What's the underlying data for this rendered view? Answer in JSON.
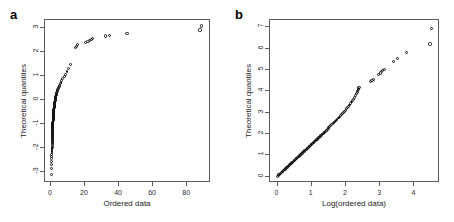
{
  "figure": {
    "width": 454,
    "height": 222,
    "background": "#ffffff",
    "point_color": "#111111",
    "axis_color": "#5a5a5a"
  },
  "panels": [
    {
      "letter": "a",
      "xlabel": "Ordered data",
      "ylabel": "Theoretical quantiles",
      "xticks": [
        "0",
        "20",
        "40",
        "60",
        "80"
      ],
      "yticks": [
        "-3",
        "-2",
        "-1",
        "0",
        "1",
        "2",
        "3"
      ]
    },
    {
      "letter": "b",
      "xlabel": "Log(ordered data)",
      "ylabel": "Theoretical quantiles",
      "xticks": [
        "0",
        "1",
        "2",
        "3",
        "4"
      ],
      "yticks": [
        "0",
        "1",
        "2",
        "3",
        "4",
        "5",
        "6",
        "7"
      ]
    }
  ],
  "chart_data": [
    {
      "type": "scatter",
      "panel": "a",
      "title": "a",
      "xlabel": "Ordered data",
      "ylabel": "Theoretical quantiles",
      "xlim": [
        -3.5,
        94
      ],
      "ylim": [
        -3.45,
        3.35
      ],
      "xticks": [
        0,
        20,
        40,
        60,
        80
      ],
      "yticks": [
        -3,
        -2,
        -1,
        0,
        1,
        2,
        3
      ],
      "grid": false,
      "legend": null,
      "series": [
        {
          "name": "normal Q-Q of ordered data",
          "x": [
            0.35,
            0.4,
            0.45,
            0.5,
            0.5,
            0.55,
            0.55,
            0.6,
            0.6,
            0.6,
            0.62,
            0.64,
            0.66,
            0.68,
            0.7,
            0.7,
            0.72,
            0.74,
            0.76,
            0.78,
            0.8,
            0.8,
            0.82,
            0.84,
            0.85,
            0.86,
            0.88,
            0.9,
            0.9,
            0.92,
            0.94,
            0.96,
            0.98,
            1.0,
            1.0,
            1.02,
            1.04,
            1.06,
            1.08,
            1.1,
            1.1,
            1.12,
            1.14,
            1.16,
            1.18,
            1.2,
            1.22,
            1.24,
            1.26,
            1.28,
            1.3,
            1.32,
            1.34,
            1.36,
            1.38,
            1.4,
            1.42,
            1.44,
            1.46,
            1.5,
            1.52,
            1.55,
            1.58,
            1.6,
            1.63,
            1.66,
            1.7,
            1.73,
            1.76,
            1.8,
            1.84,
            1.88,
            1.92,
            1.96,
            2.0,
            2.05,
            2.1,
            2.15,
            2.2,
            2.25,
            2.3,
            2.36,
            2.42,
            2.48,
            2.55,
            2.62,
            2.7,
            2.78,
            2.86,
            2.95,
            3.05,
            3.15,
            3.3,
            3.45,
            3.6,
            3.8,
            4.0,
            4.25,
            4.5,
            4.8,
            5.1,
            5.5,
            5.9,
            6.4,
            7.0,
            7.7,
            8.5,
            9.4,
            10.4,
            11.3,
            14.2,
            15.0,
            15.8,
            20.5,
            21.8,
            22.8,
            23.8,
            24.6,
            32.0,
            34.4,
            44.7,
            87.5,
            88.5
          ],
          "y": [
            -3.1,
            -2.85,
            -2.68,
            -2.55,
            -2.44,
            -2.35,
            -2.27,
            -2.2,
            -2.13,
            -2.07,
            -2.01,
            -1.96,
            -1.91,
            -1.86,
            -1.81,
            -1.77,
            -1.73,
            -1.69,
            -1.65,
            -1.61,
            -1.57,
            -1.54,
            -1.5,
            -1.47,
            -1.44,
            -1.41,
            -1.38,
            -1.35,
            -1.32,
            -1.29,
            -1.26,
            -1.23,
            -1.21,
            -1.18,
            -1.15,
            -1.13,
            -1.1,
            -1.08,
            -1.05,
            -1.03,
            -1.0,
            -0.98,
            -0.95,
            -0.93,
            -0.91,
            -0.88,
            -0.86,
            -0.84,
            -0.81,
            -0.79,
            -0.77,
            -0.74,
            -0.72,
            -0.7,
            -0.68,
            -0.65,
            -0.63,
            -0.61,
            -0.59,
            -0.56,
            -0.54,
            -0.52,
            -0.5,
            -0.47,
            -0.45,
            -0.43,
            -0.4,
            -0.38,
            -0.36,
            -0.33,
            -0.31,
            -0.29,
            -0.26,
            -0.24,
            -0.22,
            -0.19,
            -0.17,
            -0.14,
            -0.12,
            -0.09,
            -0.07,
            -0.04,
            -0.01,
            0.01,
            0.04,
            0.07,
            0.1,
            0.13,
            0.16,
            0.19,
            0.22,
            0.25,
            0.29,
            0.32,
            0.36,
            0.4,
            0.44,
            0.48,
            0.53,
            0.58,
            0.63,
            0.69,
            0.75,
            0.82,
            0.9,
            0.98,
            1.08,
            1.19,
            1.33,
            1.5,
            2.2,
            2.25,
            2.32,
            2.4,
            2.44,
            2.48,
            2.52,
            2.57,
            2.68,
            2.72,
            2.8,
            2.93,
            3.1
          ]
        }
      ]
    },
    {
      "type": "scatter",
      "panel": "b",
      "title": "b",
      "xlabel": "Log(ordered data)",
      "ylabel": "Theoretical quantiles",
      "xlim": [
        -0.22,
        4.75
      ],
      "ylim": [
        -0.3,
        7.35
      ],
      "xticks": [
        0,
        1,
        2,
        3,
        4
      ],
      "yticks": [
        0,
        1,
        2,
        3,
        4,
        5,
        6,
        7
      ],
      "grid": false,
      "legend": null,
      "series": [
        {
          "name": "log-normal Q-Q of ordered data",
          "x": [
            0.0,
            0.02,
            0.04,
            0.06,
            0.08,
            0.1,
            0.12,
            0.14,
            0.16,
            0.18,
            0.2,
            0.22,
            0.24,
            0.26,
            0.28,
            0.3,
            0.32,
            0.34,
            0.36,
            0.38,
            0.4,
            0.42,
            0.44,
            0.46,
            0.48,
            0.5,
            0.52,
            0.54,
            0.56,
            0.58,
            0.6,
            0.62,
            0.64,
            0.66,
            0.68,
            0.7,
            0.72,
            0.74,
            0.76,
            0.78,
            0.8,
            0.82,
            0.84,
            0.86,
            0.88,
            0.9,
            0.92,
            0.94,
            0.96,
            0.98,
            1.0,
            1.02,
            1.04,
            1.06,
            1.08,
            1.1,
            1.12,
            1.14,
            1.16,
            1.18,
            1.2,
            1.22,
            1.24,
            1.26,
            1.28,
            1.3,
            1.32,
            1.34,
            1.36,
            1.38,
            1.4,
            1.42,
            1.44,
            1.46,
            1.48,
            1.5,
            1.53,
            1.56,
            1.59,
            1.62,
            1.65,
            1.68,
            1.71,
            1.74,
            1.77,
            1.8,
            1.83,
            1.86,
            1.89,
            1.92,
            1.95,
            1.98,
            2.01,
            2.04,
            2.07,
            2.1,
            2.13,
            2.16,
            2.19,
            2.22,
            2.25,
            2.28,
            2.31,
            2.33,
            2.35,
            2.36,
            2.37,
            2.38,
            2.72,
            2.76,
            2.8,
            2.96,
            3.0,
            3.04,
            3.08,
            3.12,
            3.4,
            3.5,
            3.78,
            4.46,
            4.5
          ],
          "y": [
            0.02,
            0.05,
            0.08,
            0.11,
            0.14,
            0.17,
            0.2,
            0.23,
            0.26,
            0.29,
            0.32,
            0.35,
            0.38,
            0.41,
            0.44,
            0.47,
            0.5,
            0.53,
            0.56,
            0.59,
            0.62,
            0.65,
            0.68,
            0.71,
            0.74,
            0.77,
            0.8,
            0.83,
            0.86,
            0.89,
            0.92,
            0.95,
            0.98,
            1.01,
            1.04,
            1.07,
            1.1,
            1.13,
            1.16,
            1.19,
            1.22,
            1.25,
            1.28,
            1.31,
            1.34,
            1.37,
            1.4,
            1.43,
            1.46,
            1.49,
            1.52,
            1.55,
            1.58,
            1.61,
            1.64,
            1.67,
            1.7,
            1.73,
            1.76,
            1.79,
            1.82,
            1.85,
            1.88,
            1.91,
            1.94,
            1.97,
            2.0,
            2.03,
            2.06,
            2.09,
            2.12,
            2.15,
            2.18,
            2.22,
            2.26,
            2.3,
            2.35,
            2.4,
            2.45,
            2.5,
            2.55,
            2.6,
            2.65,
            2.7,
            2.75,
            2.8,
            2.85,
            2.9,
            2.95,
            3.0,
            3.06,
            3.12,
            3.18,
            3.24,
            3.3,
            3.36,
            3.43,
            3.5,
            3.57,
            3.64,
            3.72,
            3.8,
            3.88,
            3.95,
            4.02,
            4.08,
            4.13,
            4.18,
            4.48,
            4.52,
            4.57,
            4.8,
            4.86,
            4.92,
            4.98,
            5.04,
            5.42,
            5.55,
            5.83,
            6.22,
            6.95
          ]
        }
      ]
    }
  ]
}
